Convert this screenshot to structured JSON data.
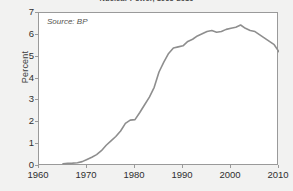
{
  "figure": {
    "title": "Nuclear Power, 1965-2010",
    "title_clipped": true,
    "background_color": "#f2f2f1",
    "plot_background_color": "#ffffff",
    "frame_color": "#9a9a9a"
  },
  "annotation": {
    "source_note": "Source: BP"
  },
  "axes": {
    "y_label": "Percent",
    "y_ticks": [
      "0",
      "1",
      "2",
      "3",
      "4",
      "5",
      "6",
      "7"
    ],
    "x_ticks": [
      "1960",
      "1970",
      "1980",
      "1990",
      "2000",
      "2010"
    ]
  },
  "chart_data": {
    "type": "line",
    "title": "Nuclear Power, 1965-2010",
    "subtitle": "",
    "xlabel": "",
    "ylabel": "Percent",
    "xlim": [
      1960,
      2010
    ],
    "ylim": [
      0,
      7
    ],
    "grid": false,
    "legend": false,
    "legend_position": "none",
    "annotations": [
      "Source: BP"
    ],
    "line_color": "#8e8e8e",
    "series": [
      {
        "name": "Nuclear share of world energy",
        "x": [
          1965,
          1966,
          1967,
          1968,
          1969,
          1970,
          1971,
          1972,
          1973,
          1974,
          1975,
          1976,
          1977,
          1978,
          1979,
          1980,
          1981,
          1982,
          1983,
          1984,
          1985,
          1986,
          1987,
          1988,
          1989,
          1990,
          1991,
          1992,
          1993,
          1994,
          1995,
          1996,
          1997,
          1998,
          1999,
          2000,
          2001,
          2002,
          2003,
          2004,
          2005,
          2006,
          2007,
          2008,
          2009,
          2010
        ],
        "values": [
          0.1,
          0.12,
          0.13,
          0.15,
          0.2,
          0.3,
          0.4,
          0.52,
          0.7,
          0.95,
          1.15,
          1.35,
          1.6,
          1.95,
          2.1,
          2.12,
          2.45,
          2.8,
          3.15,
          3.6,
          4.3,
          4.75,
          5.15,
          5.4,
          5.45,
          5.5,
          5.7,
          5.8,
          5.95,
          6.05,
          6.15,
          6.2,
          6.12,
          6.15,
          6.25,
          6.3,
          6.35,
          6.45,
          6.3,
          6.2,
          6.15,
          6.0,
          5.85,
          5.7,
          5.55,
          5.22
        ]
      }
    ]
  }
}
